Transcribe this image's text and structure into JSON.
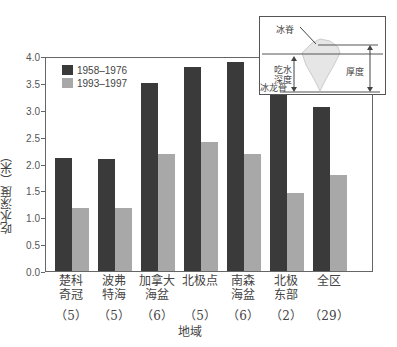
{
  "chart_data": {
    "type": "bar",
    "title": "",
    "xlabel": "地域",
    "ylabel": "吃水深度（米）",
    "ylim": [
      0,
      4.0
    ],
    "yticks": [
      "0.0",
      "0.5",
      "1.0",
      "1.5",
      "2.0",
      "2.5",
      "3.0",
      "3.5",
      "4.0"
    ],
    "categories": [
      "楚科奇冠",
      "波弗特海",
      "加拿大海盆",
      "北极点",
      "南森海盆",
      "北极东部",
      "全区"
    ],
    "category_lines": [
      [
        "楚科",
        "奇冠"
      ],
      [
        "波弗",
        "特海"
      ],
      [
        "加拿大",
        "海盆"
      ],
      [
        "北极点"
      ],
      [
        "南森",
        "海盆"
      ],
      [
        "北极",
        "东部"
      ],
      [
        "全区"
      ]
    ],
    "counts": [
      "（5）",
      "（5）",
      "（6）",
      "（5）",
      "（6）",
      "（2）",
      "（29）"
    ],
    "series": [
      {
        "name": "1958–1976",
        "color": "#3a3a3a",
        "values": [
          2.1,
          2.08,
          3.5,
          3.8,
          3.88,
          3.28,
          3.05
        ]
      },
      {
        "name": "1993–1997",
        "color": "#a8a8a8",
        "values": [
          1.18,
          1.17,
          2.18,
          2.4,
          2.18,
          1.45,
          1.78
        ]
      }
    ],
    "legend_position": "upper-left",
    "grid": false,
    "inset": {
      "labels": {
        "ridge": "冰脊",
        "draft": "吃水深度",
        "keel": "冰龙骨",
        "thickness": "厚度"
      }
    }
  }
}
